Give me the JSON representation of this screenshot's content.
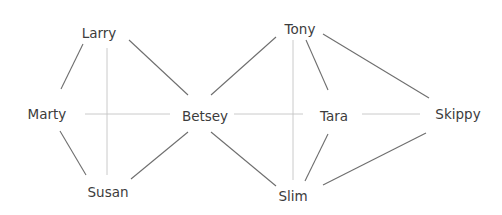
{
  "diagram": {
    "type": "social-network-graph",
    "colors": {
      "strong_edge": "#6e6e6e",
      "faint_edge": "#c4c4c4",
      "label": "#3c3c3c",
      "background": "#ffffff"
    },
    "nodes": [
      {
        "id": "larry",
        "label": "Larry",
        "x": 99,
        "y": 33
      },
      {
        "id": "marty",
        "label": "Marty",
        "x": 47,
        "y": 114
      },
      {
        "id": "susan",
        "label": "Susan",
        "x": 108,
        "y": 192
      },
      {
        "id": "betsey",
        "label": "Betsey",
        "x": 205,
        "y": 116
      },
      {
        "id": "tony",
        "label": "Tony",
        "x": 300,
        "y": 29
      },
      {
        "id": "tara",
        "label": "Tara",
        "x": 334,
        "y": 116
      },
      {
        "id": "skippy",
        "label": "Skippy",
        "x": 458,
        "y": 114
      },
      {
        "id": "slim",
        "label": "Slim",
        "x": 293,
        "y": 196
      }
    ],
    "edges": [
      {
        "from": "larry",
        "to": "marty",
        "style": "strong",
        "x1": 83,
        "y1": 44,
        "x2": 61,
        "y2": 89
      },
      {
        "from": "larry",
        "to": "betsey",
        "style": "strong",
        "x1": 129,
        "y1": 40,
        "x2": 188,
        "y2": 95
      },
      {
        "from": "marty",
        "to": "susan",
        "style": "strong",
        "x1": 60,
        "y1": 131,
        "x2": 86,
        "y2": 175
      },
      {
        "from": "susan",
        "to": "betsey",
        "style": "strong",
        "x1": 131,
        "y1": 179,
        "x2": 188,
        "y2": 132
      },
      {
        "from": "betsey",
        "to": "tony",
        "style": "strong",
        "x1": 211,
        "y1": 95,
        "x2": 276,
        "y2": 37
      },
      {
        "from": "betsey",
        "to": "slim",
        "style": "strong",
        "x1": 211,
        "y1": 132,
        "x2": 276,
        "y2": 186
      },
      {
        "from": "tony",
        "to": "tara",
        "style": "strong",
        "x1": 306,
        "y1": 40,
        "x2": 328,
        "y2": 90
      },
      {
        "from": "tony",
        "to": "skippy",
        "style": "strong",
        "x1": 323,
        "y1": 34,
        "x2": 429,
        "y2": 98
      },
      {
        "from": "tara",
        "to": "slim",
        "style": "strong",
        "x1": 328,
        "y1": 134,
        "x2": 305,
        "y2": 181
      },
      {
        "from": "skippy",
        "to": "slim",
        "style": "strong",
        "x1": 426,
        "y1": 133,
        "x2": 323,
        "y2": 185
      },
      {
        "from": "larry",
        "to": "susan",
        "style": "faint",
        "x1": 107,
        "y1": 48,
        "x2": 107,
        "y2": 175
      },
      {
        "from": "marty",
        "to": "betsey",
        "style": "faint",
        "x1": 85,
        "y1": 114,
        "x2": 170,
        "y2": 114
      },
      {
        "from": "betsey",
        "to": "tara",
        "style": "faint",
        "x1": 234,
        "y1": 114,
        "x2": 303,
        "y2": 114
      },
      {
        "from": "tony",
        "to": "slim",
        "style": "faint",
        "x1": 293,
        "y1": 40,
        "x2": 293,
        "y2": 180
      },
      {
        "from": "tara",
        "to": "skippy",
        "style": "faint",
        "x1": 362,
        "y1": 114,
        "x2": 420,
        "y2": 114
      }
    ]
  }
}
